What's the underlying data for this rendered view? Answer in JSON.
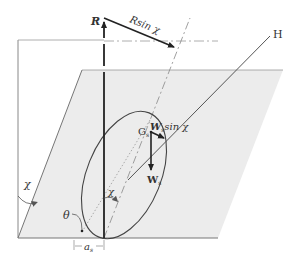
{
  "figure": {
    "colors": {
      "plane_fill": "#ececec",
      "line": "#333333",
      "frame": "#888888",
      "background": "#ffffff"
    }
  },
  "labels": {
    "R": "R",
    "R_sin_chi_main": "R",
    "R_sin_chi_rest": "sin χ",
    "H": "H",
    "G_main": "G",
    "G_sub": "s",
    "Ws_sin_main": "W",
    "Ws_sin_sub": "s",
    "Ws_sin_rest": "sin χ",
    "Ws_main": "W",
    "Ws_sub": "s",
    "chi_left": "χ",
    "chi_center": "χ",
    "theta": "θ",
    "a_main": "a",
    "a_sub": "s"
  }
}
